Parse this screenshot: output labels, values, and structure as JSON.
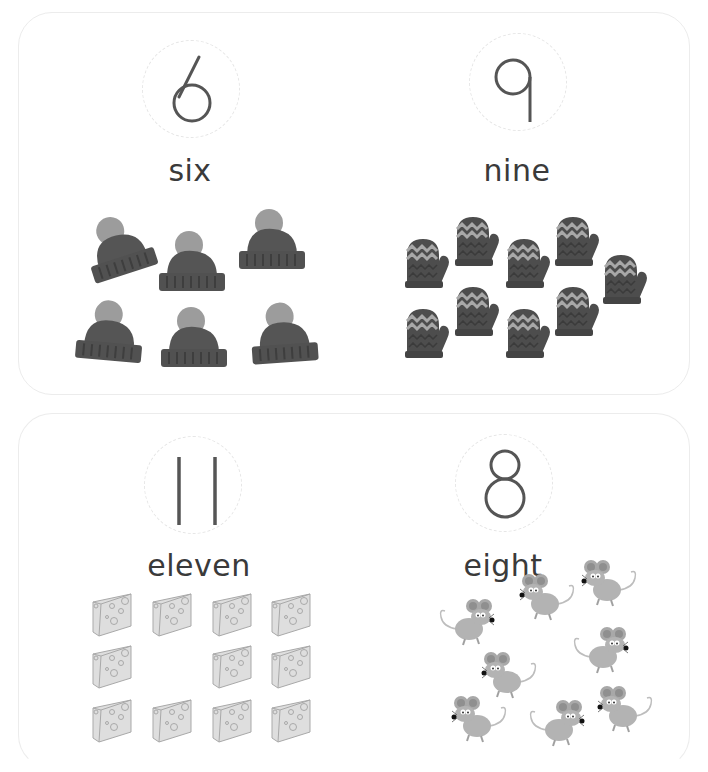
{
  "sheet": {
    "cards": [
      {
        "panels": [
          {
            "numeral": "6",
            "word": "six",
            "object": "hat",
            "count": 6
          },
          {
            "numeral": "9",
            "word": "nine",
            "object": "mitten",
            "count": 9
          }
        ]
      },
      {
        "panels": [
          {
            "numeral": "11",
            "word": "eleven",
            "object": "cheese",
            "count": 11
          },
          {
            "numeral": "8",
            "word": "eight",
            "object": "mouse",
            "count": 8
          }
        ]
      }
    ]
  },
  "colors": {
    "card_border": "#ececec",
    "numeral_stroke": "#555555",
    "dashed_circle": "#e6e6e6",
    "hat_body": "#555555",
    "hat_pompom": "#999999",
    "mitten_body": "#4d4d4d",
    "mitten_zigzag": "#a8a8a8",
    "cheese": "#d9d9d9",
    "mouse": "#b0b0b0"
  }
}
